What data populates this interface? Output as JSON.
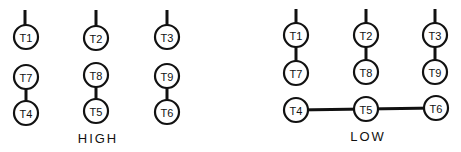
{
  "diagram": {
    "stroke_color": "#111111",
    "background": "#ffffff",
    "groups": [
      {
        "id": "high",
        "label": "HIGH",
        "label_pos": [
          98,
          143
        ],
        "terminals": [
          {
            "id": "T1",
            "label": "T1",
            "cx": 26,
            "cy": 37
          },
          {
            "id": "T2",
            "label": "T2",
            "cx": 96,
            "cy": 38
          },
          {
            "id": "T3",
            "label": "T3",
            "cx": 167,
            "cy": 37
          },
          {
            "id": "T7",
            "label": "T7",
            "cx": 26,
            "cy": 77
          },
          {
            "id": "T8",
            "label": "T8",
            "cx": 96,
            "cy": 75
          },
          {
            "id": "T9",
            "label": "T9",
            "cx": 167,
            "cy": 76
          },
          {
            "id": "T4",
            "label": "T4",
            "cx": 26,
            "cy": 113
          },
          {
            "id": "T5",
            "label": "T5",
            "cx": 96,
            "cy": 111
          },
          {
            "id": "T6",
            "label": "T6",
            "cx": 167,
            "cy": 112
          }
        ],
        "leads": [
          {
            "x": 25,
            "y1": 10,
            "y2": 25
          },
          {
            "x": 96,
            "y1": 10,
            "y2": 26
          },
          {
            "x": 167,
            "y1": 10,
            "y2": 25
          }
        ],
        "connections": [
          {
            "from": "T7",
            "to": "T4"
          },
          {
            "from": "T8",
            "to": "T5"
          },
          {
            "from": "T9",
            "to": "T6"
          }
        ]
      },
      {
        "id": "low",
        "label": "LOW",
        "label_pos": [
          368,
          141
        ],
        "terminals": [
          {
            "id": "T1",
            "label": "T1",
            "cx": 296,
            "cy": 35
          },
          {
            "id": "T2",
            "label": "T2",
            "cx": 366,
            "cy": 35
          },
          {
            "id": "T3",
            "label": "T3",
            "cx": 435,
            "cy": 35
          },
          {
            "id": "T7",
            "label": "T7",
            "cx": 296,
            "cy": 73
          },
          {
            "id": "T8",
            "label": "T8",
            "cx": 366,
            "cy": 72
          },
          {
            "id": "T9",
            "label": "T9",
            "cx": 435,
            "cy": 72
          },
          {
            "id": "T4",
            "label": "T4",
            "cx": 296,
            "cy": 110
          },
          {
            "id": "T5",
            "label": "T5",
            "cx": 366,
            "cy": 109
          },
          {
            "id": "T6",
            "label": "T6",
            "cx": 436,
            "cy": 108
          }
        ],
        "leads": [
          {
            "x": 296,
            "y1": 9,
            "y2": 23
          },
          {
            "x": 366,
            "y1": 9,
            "y2": 23
          },
          {
            "x": 435,
            "y1": 9,
            "y2": 23
          }
        ],
        "connections": [
          {
            "from": "T1",
            "to": "T7"
          },
          {
            "from": "T2",
            "to": "T8"
          },
          {
            "from": "T3",
            "to": "T9"
          },
          {
            "from": "T4",
            "to": "T5"
          },
          {
            "from": "T5",
            "to": "T6"
          }
        ]
      }
    ],
    "terminal_radius": 12
  }
}
